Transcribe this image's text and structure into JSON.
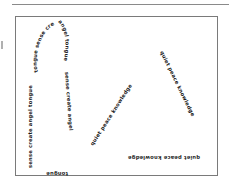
{
  "figure": {
    "keyhole_shape": {
      "words": [
        "tongue",
        "sense",
        "create",
        "angel"
      ],
      "left_side_text": "sense create angel tongue",
      "loop_left_text": "tongue sense create",
      "loop_right_text": "angel tongue",
      "right_side_text": "sense create angel",
      "bottom_text": "tongue"
    },
    "triangle_shape": {
      "words": [
        "quiet",
        "peace",
        "knowledge"
      ],
      "left_side_text": "quiet peace knowledge",
      "right_side_text": "quiet peace knowledge",
      "bottom_text": "quiet peace knowledge"
    }
  },
  "colors": {
    "ink": "#1a1a1a",
    "frame": "#7a7a7a",
    "background": "#ffffff"
  }
}
